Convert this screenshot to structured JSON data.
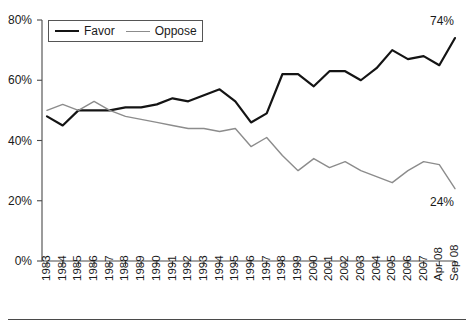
{
  "legend": {
    "entries": [
      {
        "label": "Favor",
        "color": "#141414",
        "name": "favor"
      },
      {
        "label": "Oppose",
        "color": "#8c8c8c",
        "name": "oppose"
      }
    ]
  },
  "endpoint_labels": {
    "favor": "74%",
    "oppose": "24%"
  },
  "axes": {
    "y_ticks": [
      "0%",
      "20%",
      "40%",
      "60%",
      "80%"
    ],
    "y_min": 0,
    "y_max": 80
  },
  "chart_data": {
    "type": "line",
    "title": "",
    "subtitle": "",
    "xlabel": "",
    "ylabel": "",
    "ylim": [
      0,
      80
    ],
    "ytick_values": [
      0,
      20,
      40,
      60,
      80
    ],
    "ytick_labels": [
      "0%",
      "20%",
      "40%",
      "60%",
      "80%"
    ],
    "grid": false,
    "legend_position": "top-left",
    "categories": [
      "1983",
      "1984",
      "1985",
      "1986",
      "1987",
      "1988",
      "1989",
      "1990",
      "1991",
      "1992",
      "1993",
      "1994",
      "1995",
      "1996",
      "1997",
      "1998",
      "1999",
      "2000",
      "2001",
      "2002",
      "2003",
      "2004",
      "2005",
      "2006",
      "2007",
      "Apr 08",
      "Sep 08"
    ],
    "series": [
      {
        "name": "Favor",
        "color": "#141414",
        "values": [
          48,
          45,
          50,
          50,
          50,
          51,
          51,
          52,
          54,
          53,
          55,
          57,
          53,
          46,
          49,
          62,
          62,
          58,
          63,
          63,
          60,
          64,
          70,
          67,
          68,
          65,
          74
        ],
        "end_label": "74%"
      },
      {
        "name": "Oppose",
        "color": "#8c8c8c",
        "values": [
          50,
          52,
          50,
          53,
          50,
          48,
          47,
          46,
          45,
          44,
          44,
          43,
          44,
          38,
          41,
          35,
          30,
          34,
          31,
          33,
          30,
          28,
          26,
          30,
          33,
          32,
          24
        ],
        "end_label": "24%"
      }
    ]
  }
}
